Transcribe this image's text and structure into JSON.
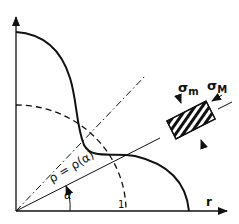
{
  "diagram": {
    "axes": {
      "x_label": "r",
      "tick_label": "1"
    },
    "labels": {
      "rho": "ρ = ρ(α)",
      "alpha": "α",
      "sigma_m": "σ",
      "sigma_m_sub": "m",
      "sigma_M": "σ",
      "sigma_M_sub": "M"
    },
    "colors": {
      "ink": "#111111",
      "background": "#ffffff"
    }
  }
}
